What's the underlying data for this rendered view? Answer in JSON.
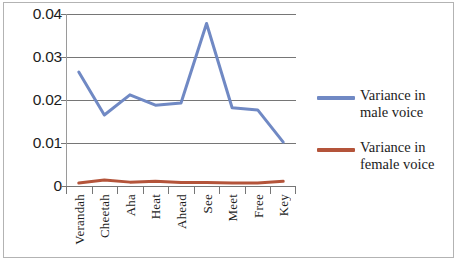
{
  "chart_data": {
    "type": "line",
    "title": "",
    "xlabel": "",
    "ylabel": "",
    "categories": [
      "Verandah",
      "Cheetah",
      "Aha",
      "Heat",
      "Ahead",
      "See",
      "Meet",
      "Free",
      "Key"
    ],
    "series": [
      {
        "name": "Variance in male voice",
        "color": "#7089c4",
        "values": [
          0.0265,
          0.0165,
          0.0212,
          0.0188,
          0.0193,
          0.0378,
          0.0182,
          0.0177,
          0.0102
        ]
      },
      {
        "name": "Variance in female voice",
        "color": "#b4543a",
        "values": [
          0.0007,
          0.0014,
          0.0009,
          0.0011,
          0.0008,
          0.0008,
          0.0007,
          0.0007,
          0.0011
        ]
      }
    ],
    "ylim": [
      0,
      0.04
    ],
    "yticks": [
      "0",
      "0.01",
      "0.02",
      "0.03",
      "0.04"
    ],
    "ytick_values": [
      0,
      0.01,
      0.02,
      0.03,
      0.04
    ],
    "grid": true,
    "legend_position": "right"
  },
  "legend": {
    "entries": [
      {
        "label": "Variance in male voice",
        "color": "#7089c4"
      },
      {
        "label": "Variance in female voice",
        "color": "#b4543a"
      }
    ]
  }
}
